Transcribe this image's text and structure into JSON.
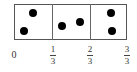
{
  "diagram": {
    "sections": 3,
    "points": [
      {
        "x": 33,
        "y": 13
      },
      {
        "x": 24,
        "y": 31
      },
      {
        "x": 62,
        "y": 26
      },
      {
        "x": 80,
        "y": 22
      },
      {
        "x": 111,
        "y": 13
      },
      {
        "x": 112,
        "y": 31
      }
    ],
    "axis_labels": [
      {
        "text": "0",
        "x": 14
      },
      {
        "num": "1",
        "den": "3",
        "x": 53
      },
      {
        "num": "2",
        "den": "3",
        "x": 90
      },
      {
        "num": "3",
        "den": "3",
        "x": 127
      }
    ]
  }
}
